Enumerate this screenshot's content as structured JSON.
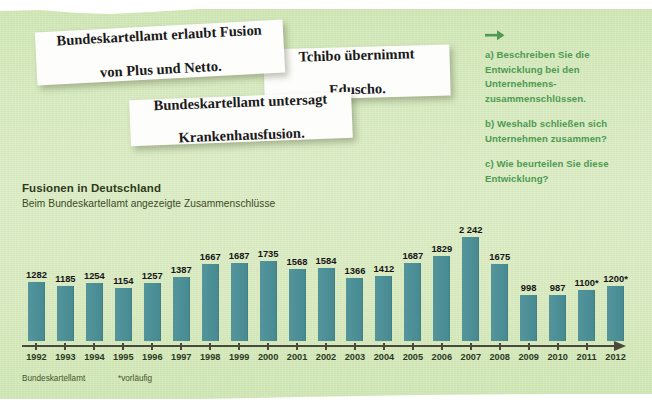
{
  "background": {
    "paper_color": "#d8ebc0",
    "accent_green": "#4e9a52",
    "bar_color": "#4e9097",
    "axis_color": "#4a4a3c"
  },
  "headlines": [
    {
      "name": "headline-card-fusion-plus-netto",
      "line1": "Bundeskartellamt erlaubt Fusion",
      "line2": "von Plus und Netto."
    },
    {
      "name": "headline-card-tchibo-eduscho",
      "line1": "Tchibo übernimmt",
      "line2": "Eduscho."
    },
    {
      "name": "headline-card-krankenhausfusion",
      "line1": "Bundeskartellamt untersagt",
      "line2": "Krankenhausfusion."
    }
  ],
  "questions": {
    "arrow_icon": "arrow-right-icon",
    "items": [
      "a) Beschreiben Sie die Entwicklung bei den Unternehmens-zusammenschlüssen.",
      "b) Weshalb schließen sich Unternehmen zusammen?",
      "c) Wie beurteilen Sie diese Entwicklung?"
    ]
  },
  "footer": {
    "source": "Bundeskartellamt",
    "note": "*vorläufig"
  },
  "chart_data": {
    "type": "bar",
    "title": "Fusionen in Deutschland",
    "subtitle": "Beim Bundeskartellamt angezeigte Zusammenschlüsse",
    "xlabel": "",
    "ylabel": "",
    "ylim": [
      0,
      2400
    ],
    "grid": false,
    "legend": false,
    "categories": [
      "1992",
      "1993",
      "1994",
      "1995",
      "1996",
      "1997",
      "1998",
      "1999",
      "2000",
      "2001",
      "2002",
      "2003",
      "2004",
      "2005",
      "2006",
      "2007",
      "2008",
      "2009",
      "2010",
      "2011",
      "2012"
    ],
    "values": [
      1282,
      1185,
      1254,
      1154,
      1257,
      1387,
      1667,
      1687,
      1735,
      1568,
      1584,
      1366,
      1412,
      1687,
      1829,
      2242,
      1675,
      998,
      987,
      1100,
      1200
    ],
    "labels": [
      "1282",
      "1185",
      "1254",
      "1154",
      "1257",
      "1387",
      "1667",
      "1687",
      "1735",
      "1568",
      "1584",
      "1366",
      "1412",
      "1687",
      "1829",
      "2 242",
      "1675",
      "998",
      "987",
      "1100*",
      "1200*"
    ]
  }
}
